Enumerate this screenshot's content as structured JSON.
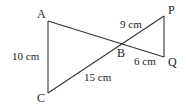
{
  "diagram": {
    "type": "two triangles sharing vertex B (bow-tie)",
    "colors": {
      "line": "#333333",
      "text": "#222222",
      "background": "#ffffff"
    },
    "points": {
      "A": {
        "label": "A",
        "x": 48,
        "y": 21
      },
      "C": {
        "label": "C",
        "x": 48,
        "y": 93
      },
      "B": {
        "label": "B",
        "x": 121,
        "y": 43
      },
      "P": {
        "label": "P",
        "x": 164,
        "y": 16
      },
      "Q": {
        "label": "Q",
        "x": 164,
        "y": 57
      }
    },
    "segments": [
      {
        "id": "AC",
        "from": "A",
        "to": "C"
      },
      {
        "id": "AQ",
        "from": "A",
        "to": "Q",
        "passes_through": "B"
      },
      {
        "id": "CP",
        "from": "C",
        "to": "P",
        "passes_through": "B"
      },
      {
        "id": "PQ",
        "from": "P",
        "to": "Q"
      }
    ],
    "measurements": {
      "AC": "10 cm",
      "BP": "9 cm",
      "BQ": "6 cm",
      "BC": "15 cm"
    }
  }
}
